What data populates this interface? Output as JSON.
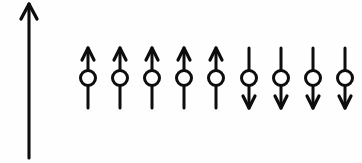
{
  "figure": {
    "name": "spin-chain-diagram",
    "description": "Hand-drawn magnetic spin chain: a tall vertical axis arrow at left and a horizontal row of nine spin symbols, each a circle pierced by a vertical arrow.",
    "background_color": "#fefefe",
    "ink_color": "#0d0d0d",
    "width": 362,
    "height": 163
  },
  "axis": {
    "name": "vertical-axis-arrow",
    "label": "",
    "direction": "up",
    "x": 29,
    "y_top": 4,
    "y_bottom": 158,
    "head_half_width": 8,
    "head_height": 15,
    "stroke_width": 3.1
  },
  "chart_data": {
    "type": "diagram",
    "title": "",
    "xlabel": "",
    "ylabel": "",
    "legend": [],
    "spin_count": 9,
    "up_count": 5,
    "down_count": 4,
    "categories": [
      "1",
      "2",
      "3",
      "4",
      "5",
      "6",
      "7",
      "8",
      "9"
    ],
    "values": [
      1,
      1,
      1,
      1,
      1,
      -1,
      -1,
      -1,
      -1
    ],
    "orientations": [
      "up",
      "up",
      "up",
      "up",
      "up",
      "down",
      "down",
      "down",
      "down"
    ],
    "x_positions": [
      88,
      120,
      152,
      184,
      216,
      249,
      281,
      313,
      345
    ],
    "circle_center_y": 78,
    "circle_radius": 7.5,
    "spin_top_y": 48,
    "spin_bottom_y": 108,
    "arrow_head_half_width": 6,
    "arrow_head_height": 12,
    "spacing": 32,
    "grid": false,
    "ylim": [
      -1,
      1
    ]
  }
}
